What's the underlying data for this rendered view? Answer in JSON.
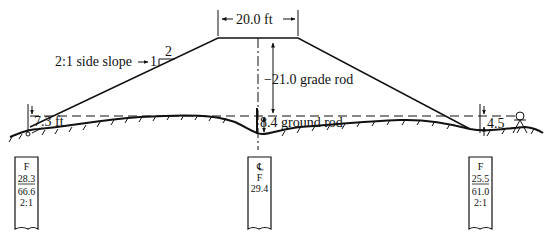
{
  "diagram": {
    "type": "road fill cross-section",
    "colors": {
      "ink": "#111111",
      "background": "#ffffff"
    },
    "top_width_label": "20.0 ft",
    "side_slope": {
      "label": "2:1 side slope",
      "rise": "1",
      "run": "2"
    },
    "grade_rod_label": "−21.0 grade rod",
    "ground_rod_label": "8.4 ground rod",
    "left_hi_label": "7.3 ft",
    "right_hi_label": "4.5",
    "stakes": [
      {
        "position": "left",
        "lines": [
          "F",
          "28.3",
          "66.6",
          "2:1"
        ],
        "underline_index": 1
      },
      {
        "position": "center",
        "lines": [
          "℄",
          "F",
          "29.4"
        ],
        "underline_index": null
      },
      {
        "position": "right",
        "lines": [
          "F",
          "25.5",
          "61.0",
          "2:1"
        ],
        "underline_index": 1
      }
    ],
    "icons": [
      "level-instrument-icon",
      "centerline-icon",
      "arrow-icon"
    ]
  }
}
